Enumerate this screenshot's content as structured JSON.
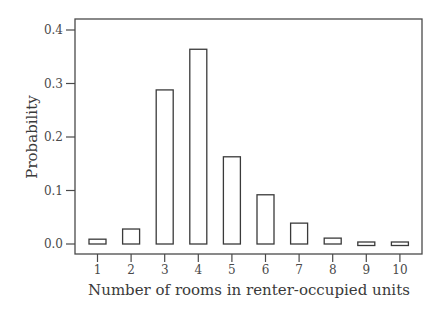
{
  "chart_data": {
    "type": "bar",
    "title": "",
    "xlabel": "Number of rooms in renter-occupied units",
    "ylabel": "Probability",
    "categories": [
      "1",
      "2",
      "3",
      "4",
      "5",
      "6",
      "7",
      "8",
      "9",
      "10"
    ],
    "values": [
      0.009,
      0.028,
      0.288,
      0.364,
      0.163,
      0.092,
      0.039,
      0.011,
      0.004,
      0.004
    ],
    "ylim": [
      -0.02,
      0.42
    ],
    "yticks": [
      0.0,
      0.1,
      0.2,
      0.3,
      0.4
    ],
    "ytick_labels": [
      "0.0",
      "0.1",
      "0.2",
      "0.3",
      "0.4"
    ],
    "grid": false,
    "legend": null,
    "bar_fill": "#ffffff",
    "bar_stroke": "#3a3a3a"
  }
}
